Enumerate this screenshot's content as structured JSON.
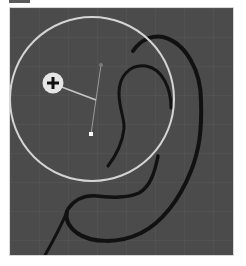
{
  "canvas": {
    "background": "#4b4b4b",
    "grid_color": "#575757",
    "grid_spacing": 29
  },
  "brush_cursor": {
    "center": [
      91,
      98
    ],
    "radius": 82,
    "ring_color": "#d4d4d4",
    "mode_icon": "plus-icon"
  },
  "strokes": {
    "color": "#111111",
    "count": 4
  }
}
